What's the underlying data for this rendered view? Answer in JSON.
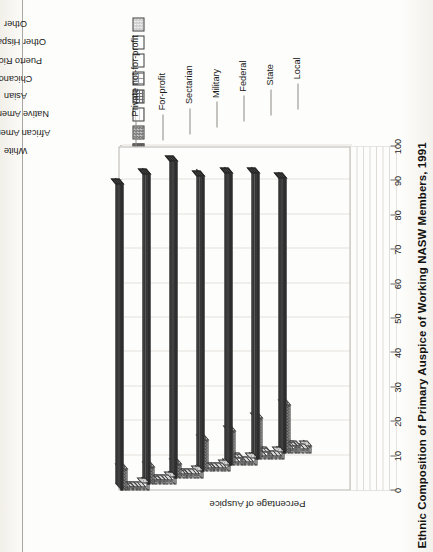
{
  "figure": {
    "title": "Ethnic Composition of Primary Auspice of Working NASW Members, 1991"
  },
  "legend": {
    "items": [
      {
        "label": "White",
        "pattern": "p-white"
      },
      {
        "label": "African American",
        "pattern": "p-afram"
      },
      {
        "label": "Native American",
        "pattern": "p-native"
      },
      {
        "label": "Asian",
        "pattern": "p-asian"
      },
      {
        "label": "Chicano",
        "pattern": "p-chicano"
      },
      {
        "label": "Puerto Rican",
        "pattern": "p-prican"
      },
      {
        "label": "Other Hispanic",
        "pattern": "p-othhisp"
      },
      {
        "label": "Other",
        "pattern": "p-other"
      }
    ]
  },
  "axes": {
    "value_title": "Percentage of Auspice",
    "value_ticks": [
      "0",
      "10",
      "20",
      "30",
      "40",
      "50",
      "60",
      "70",
      "80",
      "90",
      "100"
    ],
    "category_labels": [
      "Local",
      "State",
      "Federal",
      "Military",
      "Sectarian",
      "For-profit",
      "Private not-for-profit"
    ]
  },
  "chart_data": {
    "type": "bar",
    "title": "Ethnic Composition of Primary Auspice of Working NASW Members, 1991",
    "xlabel": "",
    "ylabel": "Percentage of Auspice",
    "ylim": [
      0,
      100
    ],
    "grid": true,
    "legend_position": "top-right",
    "orientation": "3d-clustered-columns",
    "categories": [
      "Local",
      "State",
      "Federal",
      "Military",
      "Sectarian",
      "For-profit",
      "Private not-for-profit"
    ],
    "series": [
      {
        "name": "White",
        "values": [
          80,
          83,
          85,
          86,
          92,
          90,
          89
        ]
      },
      {
        "name": "African American",
        "values": [
          14,
          12,
          10,
          9,
          4,
          5,
          6
        ]
      },
      {
        "name": "Native American",
        "values": [
          1,
          1,
          1,
          1,
          1,
          1,
          1
        ]
      },
      {
        "name": "Asian",
        "values": [
          2,
          2,
          2,
          1,
          1,
          1,
          1
        ]
      },
      {
        "name": "Chicano",
        "values": [
          2,
          1,
          1,
          1,
          1,
          1,
          1
        ]
      },
      {
        "name": "Puerto Rican",
        "values": [
          1,
          1,
          1,
          1,
          1,
          1,
          1
        ]
      },
      {
        "name": "Other Hispanic",
        "values": [
          1,
          1,
          1,
          1,
          1,
          1,
          1
        ]
      },
      {
        "name": "Other",
        "values": [
          2,
          2,
          2,
          2,
          2,
          2,
          2
        ]
      }
    ]
  }
}
